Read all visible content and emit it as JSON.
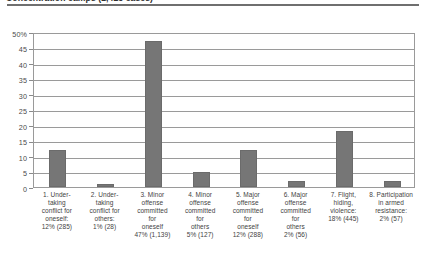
{
  "title": "Concentration camps (2,425 cases)",
  "chart_data": {
    "type": "bar",
    "title": "Concentration camps (2,425 cases)",
    "xlabel": "",
    "ylabel": "",
    "ylim": [
      0,
      50
    ],
    "grid": true,
    "legend": "none",
    "orientation": "vertical",
    "bar_color": "#767676",
    "y_ticks": [
      "0",
      "5",
      "10",
      "15",
      "20",
      "25",
      "30",
      "35",
      "40",
      "45",
      "50%"
    ],
    "y_tick_values": [
      0,
      5,
      10,
      15,
      20,
      25,
      30,
      35,
      40,
      45,
      50
    ],
    "categories": [
      "1. Undertaking conflict for oneself:",
      "2. Undertaking conflict for others:",
      "3. Minor offense committed for oneself",
      "4. Minor offense committed for others",
      "5. Major offense committed for oneself",
      "6. Major offense committed for others",
      "7. Flight, hiding, violence:",
      "8. Participation in armed resistance:"
    ],
    "category_lines": [
      [
        "1. Under-",
        "taking",
        "conflict for",
        "oneself:"
      ],
      [
        "2. Under-",
        "taking",
        "conflict for",
        "others:"
      ],
      [
        "3. Minor",
        "offense",
        "committed",
        "for",
        "oneself"
      ],
      [
        "4. Minor",
        "offense",
        "committed",
        "for",
        "others"
      ],
      [
        "5. Major",
        "offense",
        "committed",
        "for",
        "oneself"
      ],
      [
        "6. Major",
        "offense",
        "committed",
        "for",
        "others"
      ],
      [
        "7. Flight,",
        "hiding,",
        "violence:"
      ],
      [
        "8. Participation",
        "in armed",
        "resistance:"
      ]
    ],
    "values": [
      12,
      1,
      47,
      5,
      12,
      2,
      18,
      2
    ],
    "counts": [
      285,
      28,
      1139,
      127,
      288,
      56,
      445,
      57
    ],
    "data_labels": [
      "12% (285)",
      "1% (28)",
      "47% (1,139)",
      "5% (127)",
      "12% (288)",
      "2% (56)",
      "18% (445)",
      "2% (57)"
    ]
  }
}
